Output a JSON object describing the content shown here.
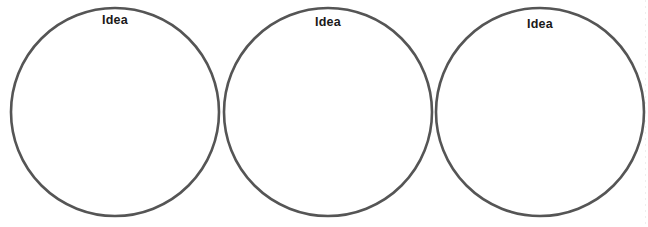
{
  "page": {
    "background_color": "#ffffff",
    "width": 648,
    "height": 227
  },
  "style": {
    "circle_stroke_color": "#555555",
    "circle_stroke_width": 2.6,
    "circle_fill": "#ffffff",
    "label_color": "#1a1a1a",
    "label_font_weight": "bold",
    "label_font_size_px": 12.5
  },
  "circles": [
    {
      "id": "circle-1",
      "label": "Idea",
      "center_x": 115,
      "center_y": 112,
      "radius": 104,
      "label_x": 115,
      "label_y": 14
    },
    {
      "id": "circle-2",
      "label": "Idea",
      "center_x": 328,
      "center_y": 112,
      "radius": 104,
      "label_x": 328,
      "label_y": 16
    },
    {
      "id": "circle-3",
      "label": "Idea",
      "center_x": 540,
      "center_y": 112,
      "radius": 104,
      "label_x": 540,
      "label_y": 18
    }
  ],
  "edge_artifact": {
    "name": "right-edge-dotted-artifact",
    "color": "#e9e9e9"
  }
}
